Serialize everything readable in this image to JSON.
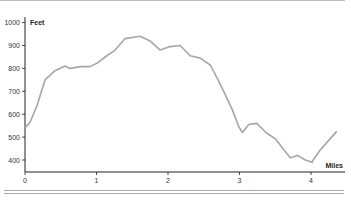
{
  "chart_data": {
    "type": "line",
    "title": "",
    "xlabel": "Miles",
    "ylabel": "Feet",
    "xlim": [
      0,
      4.4
    ],
    "ylim": [
      350,
      1000
    ],
    "x_ticks": [
      "0",
      "1",
      "2",
      "3",
      "4"
    ],
    "y_ticks": [
      "1000",
      "900",
      "800",
      "700",
      "600",
      "500",
      "400"
    ],
    "grid": false,
    "legend": null,
    "series": [
      {
        "name": "Elevation profile",
        "color": "#a6a6a6",
        "x": [
          0,
          0.07,
          0.17,
          0.28,
          0.42,
          0.56,
          0.63,
          0.77,
          0.91,
          1.02,
          1.12,
          1.26,
          1.4,
          1.61,
          1.75,
          1.89,
          2.03,
          2.17,
          2.31,
          2.45,
          2.59,
          2.7,
          2.8,
          2.9,
          2.99,
          3.04,
          3.13,
          3.24,
          3.37,
          3.51,
          3.62,
          3.71,
          3.81,
          3.92,
          4.02,
          4.01,
          4.12,
          4.26,
          4.36
        ],
        "y": [
          540,
          565,
          640,
          750,
          790,
          810,
          800,
          808,
          808,
          825,
          850,
          880,
          930,
          940,
          920,
          880,
          895,
          900,
          855,
          845,
          815,
          750,
          685,
          620,
          545,
          520,
          555,
          560,
          520,
          490,
          445,
          410,
          420,
          400,
          390,
          390,
          440,
          490,
          525
        ]
      }
    ]
  },
  "axes": {
    "y_title": "Feet",
    "x_title": "Miles",
    "y_tick_labels": [
      "1000",
      "900",
      "800",
      "700",
      "600",
      "500",
      "400"
    ],
    "x_tick_labels": [
      "0",
      "1",
      "2",
      "3",
      "4"
    ]
  }
}
